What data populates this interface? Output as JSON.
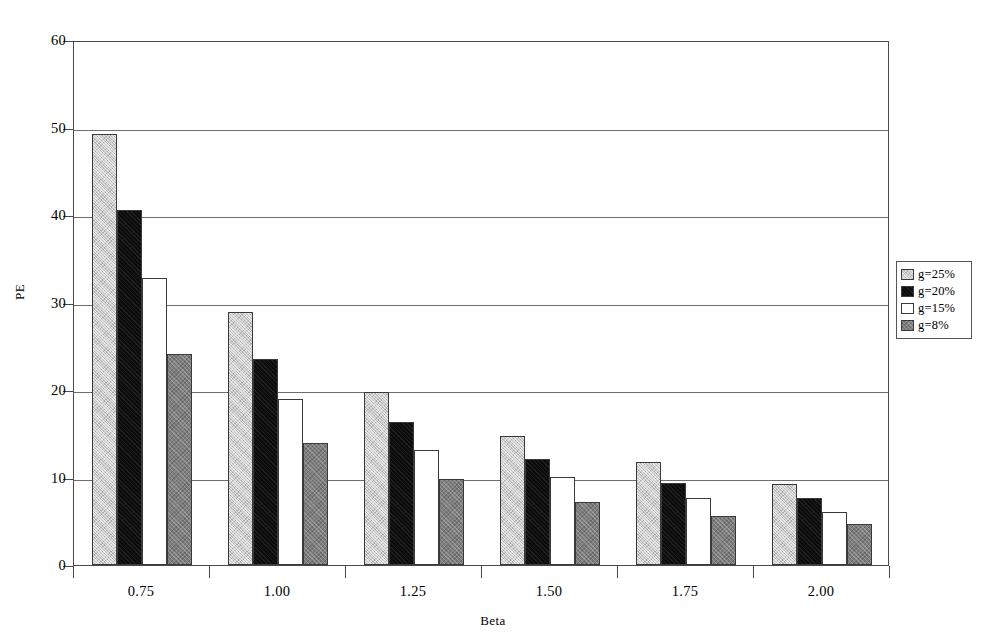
{
  "chart_data": {
    "type": "bar",
    "title": "",
    "xlabel": "Beta",
    "ylabel": "PE",
    "categories": [
      "0.75",
      "1.00",
      "1.25",
      "1.50",
      "1.75",
      "2.00"
    ],
    "series": [
      {
        "name": "g=25%",
        "color": "#c9c9c9",
        "values": [
          49.3,
          28.9,
          19.8,
          14.7,
          11.8,
          9.3
        ]
      },
      {
        "name": "g=20%",
        "color": "#0d0d0d",
        "values": [
          40.6,
          23.5,
          16.3,
          12.1,
          9.4,
          7.7
        ]
      },
      {
        "name": "g=15%",
        "color": "#ffffff",
        "values": [
          32.8,
          19.0,
          13.2,
          10.1,
          7.7,
          6.1
        ]
      },
      {
        "name": "g=8%",
        "color": "#7e7e7e",
        "values": [
          24.1,
          14.0,
          9.8,
          7.2,
          5.6,
          4.7
        ]
      }
    ],
    "ylim": [
      0,
      60
    ],
    "yticks": [
      0,
      10,
      20,
      30,
      40,
      50,
      60
    ],
    "grid": true,
    "legend_position": "right"
  },
  "legend": {
    "entries": [
      {
        "label": "g=25%"
      },
      {
        "label": "g=20%"
      },
      {
        "label": "g=15%"
      },
      {
        "label": "g=8%"
      }
    ]
  },
  "axes": {
    "y_title": "PE",
    "x_title": "Beta",
    "y_tick_labels": [
      "0",
      "10",
      "20",
      "30",
      "40",
      "50",
      "60"
    ],
    "x_tick_labels": [
      "0.75",
      "1.00",
      "1.25",
      "1.50",
      "1.75",
      "2.00"
    ]
  }
}
